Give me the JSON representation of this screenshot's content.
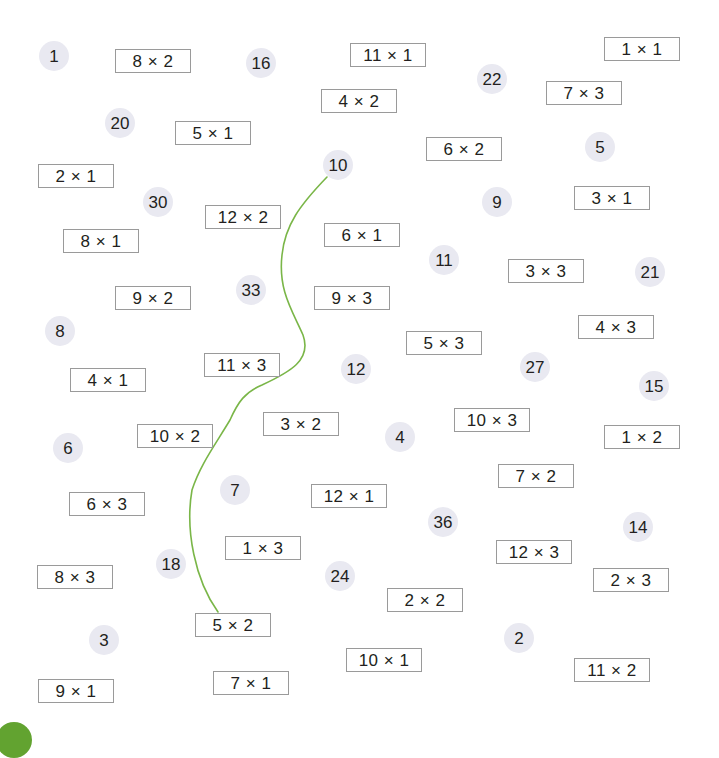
{
  "puzzle": {
    "colors": {
      "circle_fill": "#e9e9f1",
      "box_border": "#9a9a9a",
      "path_line": "#7ab648",
      "corner_tab": "#62a330"
    },
    "numbers": [
      {
        "label": "1",
        "x": 54,
        "y": 56
      },
      {
        "label": "16",
        "x": 261,
        "y": 63
      },
      {
        "label": "22",
        "x": 492,
        "y": 79
      },
      {
        "label": "20",
        "x": 120,
        "y": 123
      },
      {
        "label": "10",
        "x": 338,
        "y": 165
      },
      {
        "label": "5",
        "x": 600,
        "y": 147
      },
      {
        "label": "30",
        "x": 158,
        "y": 202
      },
      {
        "label": "9",
        "x": 497,
        "y": 202
      },
      {
        "label": "11",
        "x": 444,
        "y": 260
      },
      {
        "label": "21",
        "x": 650,
        "y": 272
      },
      {
        "label": "33",
        "x": 251,
        "y": 290
      },
      {
        "label": "8",
        "x": 60,
        "y": 331
      },
      {
        "label": "12",
        "x": 356,
        "y": 369
      },
      {
        "label": "27",
        "x": 535,
        "y": 367
      },
      {
        "label": "15",
        "x": 654,
        "y": 386
      },
      {
        "label": "4",
        "x": 400,
        "y": 437
      },
      {
        "label": "6",
        "x": 68,
        "y": 448
      },
      {
        "label": "7",
        "x": 235,
        "y": 490
      },
      {
        "label": "36",
        "x": 443,
        "y": 522
      },
      {
        "label": "14",
        "x": 638,
        "y": 527
      },
      {
        "label": "18",
        "x": 171,
        "y": 564
      },
      {
        "label": "24",
        "x": 340,
        "y": 576
      },
      {
        "label": "3",
        "x": 104,
        "y": 640
      },
      {
        "label": "2",
        "x": 519,
        "y": 638
      }
    ],
    "products": [
      {
        "label": "8 × 2",
        "x": 115,
        "y": 49
      },
      {
        "label": "11 × 1",
        "x": 350,
        "y": 43
      },
      {
        "label": "1 × 1",
        "x": 604,
        "y": 37
      },
      {
        "label": "4 × 2",
        "x": 321,
        "y": 89
      },
      {
        "label": "7 × 3",
        "x": 546,
        "y": 81
      },
      {
        "label": "5 × 1",
        "x": 175,
        "y": 121
      },
      {
        "label": "6 × 2",
        "x": 426,
        "y": 137
      },
      {
        "label": "2 × 1",
        "x": 38,
        "y": 164
      },
      {
        "label": "3 × 1",
        "x": 574,
        "y": 186
      },
      {
        "label": "12 × 2",
        "x": 205,
        "y": 205
      },
      {
        "label": "6 × 1",
        "x": 324,
        "y": 223
      },
      {
        "label": "8 × 1",
        "x": 63,
        "y": 229
      },
      {
        "label": "3 × 3",
        "x": 508,
        "y": 259
      },
      {
        "label": "9 × 2",
        "x": 115,
        "y": 286
      },
      {
        "label": "9 × 3",
        "x": 314,
        "y": 286
      },
      {
        "label": "4 × 3",
        "x": 578,
        "y": 315
      },
      {
        "label": "5 × 3",
        "x": 406,
        "y": 331
      },
      {
        "label": "11 × 3",
        "x": 204,
        "y": 353
      },
      {
        "label": "4 × 1",
        "x": 70,
        "y": 368
      },
      {
        "label": "10 × 3",
        "x": 454,
        "y": 408
      },
      {
        "label": "3 × 2",
        "x": 263,
        "y": 412
      },
      {
        "label": "1 × 2",
        "x": 604,
        "y": 425
      },
      {
        "label": "10 × 2",
        "x": 137,
        "y": 424
      },
      {
        "label": "7 × 2",
        "x": 498,
        "y": 464
      },
      {
        "label": "12 × 1",
        "x": 311,
        "y": 484
      },
      {
        "label": "6 × 3",
        "x": 69,
        "y": 492
      },
      {
        "label": "1 × 3",
        "x": 225,
        "y": 536
      },
      {
        "label": "12 × 3",
        "x": 496,
        "y": 540
      },
      {
        "label": "8 × 3",
        "x": 37,
        "y": 565
      },
      {
        "label": "2 × 3",
        "x": 593,
        "y": 568
      },
      {
        "label": "2 × 2",
        "x": 387,
        "y": 588
      },
      {
        "label": "5 × 2",
        "x": 195,
        "y": 613
      },
      {
        "label": "10 × 1",
        "x": 346,
        "y": 648
      },
      {
        "label": "11 × 2",
        "x": 574,
        "y": 658
      },
      {
        "label": "7 × 1",
        "x": 213,
        "y": 671
      },
      {
        "label": "9 × 1",
        "x": 38,
        "y": 679
      }
    ],
    "path": "M 327 177 C 300 205, 285 225, 282 255 C 278 290, 292 310, 303 335 C 312 360, 290 372, 262 385 C 245 392, 238 402, 230 420 C 215 445, 200 465, 192 490 C 185 530, 195 580, 218 612"
  }
}
